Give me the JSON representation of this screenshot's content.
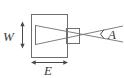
{
  "figure": {
    "kind": "technical-line-diagram",
    "background_color": "#ffffff",
    "line_color": "#6e6e6e",
    "dimension_color": "#4a4a4a",
    "text_color": "#3a3a3a"
  },
  "labels": {
    "width": "W",
    "extent": "E",
    "angle": "A"
  },
  "shapes": {
    "main_box": {
      "name": "source-body-rectangle",
      "x": 31,
      "y": 14,
      "width": 37,
      "height": 44
    },
    "small_box": {
      "name": "crossover-aperture-rectangle",
      "x": 66,
      "y": 28,
      "width": 14,
      "height": 16
    },
    "source_line": {
      "name": "source-aperture-line",
      "x": 35,
      "y1": 25,
      "y2": 45
    }
  },
  "rays": [
    {
      "name": "ray-upper",
      "x1": 35,
      "y1": 25,
      "x2": 122,
      "y2": 41
    },
    {
      "name": "ray-lower",
      "x1": 35,
      "y1": 45,
      "x2": 122,
      "y2": 27
    }
  ],
  "dimensions": {
    "width_arrow": {
      "name": "width-dimension-arrow",
      "orientation": "vertical",
      "x": 22,
      "y1": 23,
      "y2": 47,
      "label": "W"
    },
    "extent_arrow": {
      "name": "extent-dimension-arrow",
      "orientation": "horizontal",
      "y": 62,
      "x1": 32,
      "x2": 67,
      "label": "E"
    },
    "angle_marker": {
      "name": "divergence-angle-marker",
      "apex_x": 82,
      "apex_y": 34,
      "label": "A"
    }
  }
}
